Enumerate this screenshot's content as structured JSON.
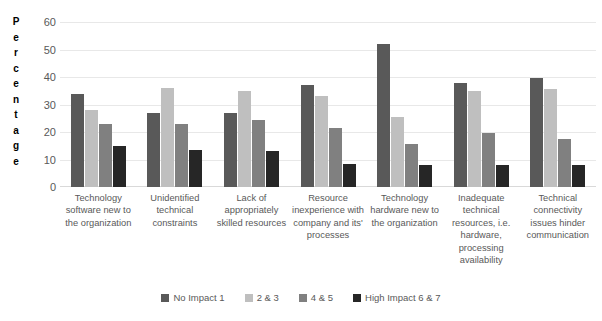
{
  "chart_data": {
    "type": "bar",
    "title": "",
    "subtitle": "",
    "xlabel": "",
    "ylabel": "Percentage",
    "ylim": [
      0,
      60
    ],
    "ytick_step": 10,
    "yticks": [
      0,
      10,
      20,
      30,
      40,
      50,
      60
    ],
    "grid": true,
    "legend_position": "bottom",
    "categories": [
      "Technology software new to the organization",
      "Unidentified technical constraints",
      "Lack of appropriately skilled resources",
      "Resource inexperience with company and its' processes",
      "Technology hardware new to the organization",
      "Inadequate technical resources, i.e. hardware, processing availability",
      "Technical connectivity issues hinder communication"
    ],
    "series": [
      {
        "name": "No Impact 1",
        "color": "#595959",
        "values": [
          34,
          27,
          27,
          37,
          52,
          38,
          39.5
        ]
      },
      {
        "name": "2 & 3",
        "color": "#bfbfbf",
        "values": [
          28,
          36,
          35,
          33,
          25.5,
          35,
          35.5
        ]
      },
      {
        "name": "4 & 5",
        "color": "#808080",
        "values": [
          23,
          23,
          24.5,
          21.5,
          15.5,
          19.5,
          17.5
        ]
      },
      {
        "name": "High Impact 6 & 7",
        "color": "#262626",
        "values": [
          15,
          13.5,
          13,
          8.5,
          8,
          8,
          8
        ]
      }
    ]
  },
  "axis": {
    "y_title_letters": [
      "P",
      "e",
      "r",
      "c",
      "e",
      "n",
      "t",
      "a",
      "g",
      "e"
    ]
  },
  "colors": {
    "gridline": "#e8e8e8",
    "axis_line": "#d9d9d9",
    "tick_text": "#595959",
    "label_text": "#595959",
    "title_text": "#000000",
    "background": "#ffffff"
  }
}
